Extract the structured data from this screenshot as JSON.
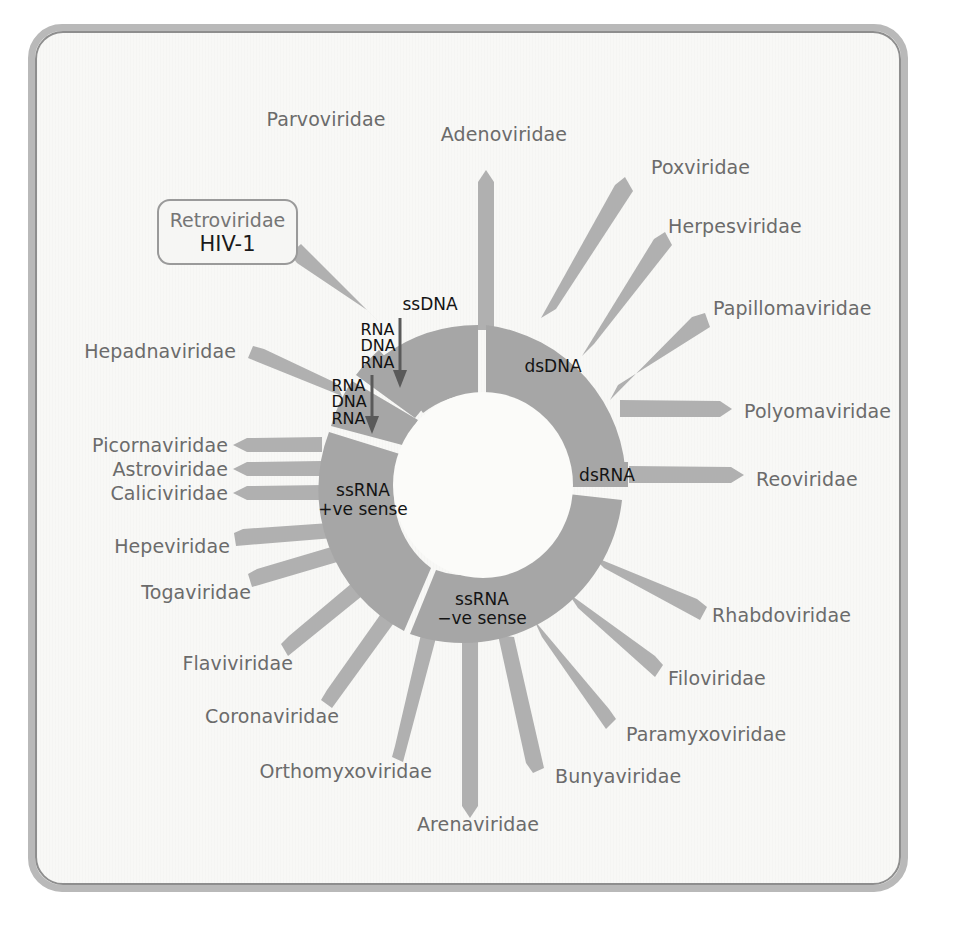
{
  "figure": {
    "kind": "virus-classification-wheel",
    "background_color": "#f8f8f6",
    "frame_color": "#b9b9b9",
    "sector_color": "#a6a6a6",
    "spoke_color": "#b0b0b0",
    "hub_color": "#fbfbf9",
    "label_color": "#6b6b6b"
  },
  "callout": {
    "family": "Retroviridae",
    "virus": "HIV-1"
  },
  "genome_groups": [
    {
      "id": "ssdna",
      "label": "ssDNA",
      "line1": "ssDNA",
      "line2": ""
    },
    {
      "id": "dsdna",
      "label": "dsDNA",
      "line1": "dsDNA",
      "line2": ""
    },
    {
      "id": "dsrna",
      "label": "dsRNA",
      "line1": "dsRNA",
      "line2": ""
    },
    {
      "id": "ssrna_neg",
      "label": "ssRNA −ve sense",
      "line1": "ssRNA",
      "line2": "−ve sense"
    },
    {
      "id": "ssrna_pos",
      "label": "ssRNA +ve sense",
      "line1": "ssRNA",
      "line2": "+ve sense"
    }
  ],
  "conversion_steps": [
    {
      "id": "conv-upper",
      "lines": [
        "RNA",
        "DNA",
        "RNA"
      ],
      "arrow": "down-arrow"
    },
    {
      "id": "conv-lower",
      "lines": [
        "RNA",
        "DNA",
        "RNA"
      ],
      "arrow": "down-arrow"
    }
  ],
  "families": [
    {
      "name": "Parvoviridae",
      "group": "ssDNA",
      "side": "top"
    },
    {
      "name": "Adenoviridae",
      "group": "dsDNA",
      "side": "top"
    },
    {
      "name": "Poxviridae",
      "group": "dsDNA",
      "side": "top-right"
    },
    {
      "name": "Herpesviridae",
      "group": "dsDNA",
      "side": "right"
    },
    {
      "name": "Papillomaviridae",
      "group": "dsDNA",
      "side": "right"
    },
    {
      "name": "Polyomaviridae",
      "group": "dsDNA",
      "side": "right"
    },
    {
      "name": "Reoviridae",
      "group": "dsRNA",
      "side": "right"
    },
    {
      "name": "Rhabdoviridae",
      "group": "ssRNA −ve sense",
      "side": "bottom-right"
    },
    {
      "name": "Filoviridae",
      "group": "ssRNA −ve sense",
      "side": "bottom-right"
    },
    {
      "name": "Paramyxoviridae",
      "group": "ssRNA −ve sense",
      "side": "bottom-right"
    },
    {
      "name": "Bunyaviridae",
      "group": "ssRNA −ve sense",
      "side": "bottom"
    },
    {
      "name": "Arenaviridae",
      "group": "ssRNA −ve sense",
      "side": "bottom"
    },
    {
      "name": "Orthomyxoviridae",
      "group": "ssRNA −ve sense",
      "side": "bottom"
    },
    {
      "name": "Coronaviridae",
      "group": "ssRNA +ve sense",
      "side": "bottom-left"
    },
    {
      "name": "Flaviviridae",
      "group": "ssRNA +ve sense",
      "side": "bottom-left"
    },
    {
      "name": "Togaviridae",
      "group": "ssRNA +ve sense",
      "side": "left"
    },
    {
      "name": "Hepeviridae",
      "group": "ssRNA +ve sense",
      "side": "left"
    },
    {
      "name": "Caliciviridae",
      "group": "ssRNA +ve sense",
      "side": "left"
    },
    {
      "name": "Astroviridae",
      "group": "ssRNA +ve sense",
      "side": "left"
    },
    {
      "name": "Picornaviridae",
      "group": "ssRNA +ve sense",
      "side": "left"
    },
    {
      "name": "Hepadnaviridae",
      "group": "conv-lower",
      "side": "left"
    },
    {
      "name": "Retroviridae",
      "group": "conv-upper",
      "side": "top-left"
    }
  ],
  "label_positions": {
    "Parvoviridae": {
      "x": 326,
      "y": 119,
      "align": "c"
    },
    "Adenoviridae": {
      "x": 504,
      "y": 134,
      "align": "c"
    },
    "Poxviridae": {
      "x": 651,
      "y": 167,
      "align": "l-left"
    },
    "Herpesviridae": {
      "x": 668,
      "y": 226,
      "align": "r"
    },
    "Papillomaviridae": {
      "x": 713,
      "y": 308,
      "align": "r"
    },
    "Polyomaviridae": {
      "x": 738,
      "y": 411,
      "align": "r"
    },
    "Reoviridae": {
      "x": 750,
      "y": 479,
      "align": "r"
    },
    "Rhabdoviridae": {
      "x": 710,
      "y": 615,
      "align": "r"
    },
    "Filoviridae": {
      "x": 667,
      "y": 678,
      "align": "r"
    },
    "Paramyxoviridae": {
      "x": 626,
      "y": 734,
      "align": "r"
    },
    "Bunyaviridae": {
      "x": 555,
      "y": 776,
      "align": "r"
    },
    "Arenaviridae": {
      "x": 478,
      "y": 824,
      "align": "c"
    },
    "Orthomyxoviridae": {
      "x": 430,
      "y": 771,
      "align": "l"
    },
    "Coronaviridae": {
      "x": 337,
      "y": 716,
      "align": "l"
    },
    "Flaviviridae": {
      "x": 291,
      "y": 663,
      "align": "l"
    },
    "Togaviridae": {
      "x": 251,
      "y": 592,
      "align": "l"
    },
    "Hepeviridae": {
      "x": 230,
      "y": 546,
      "align": "l"
    },
    "Caliciviridae": {
      "x": 227,
      "y": 493,
      "align": "l"
    },
    "Astroviridae": {
      "x": 227,
      "y": 469,
      "align": "l"
    },
    "Picornaviridae": {
      "x": 227,
      "y": 445,
      "align": "l"
    },
    "Hepadnaviridae": {
      "x": 235,
      "y": 351,
      "align": "l"
    }
  }
}
